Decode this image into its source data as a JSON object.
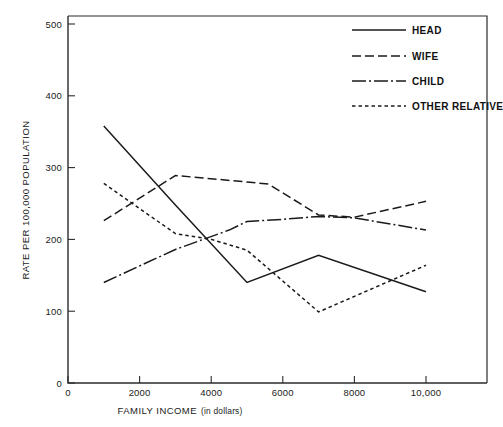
{
  "chart_data": {
    "type": "line",
    "title": "",
    "xlabel": "FAMILY INCOME (in dollars)",
    "xlabel_main": "FAMILY INCOME",
    "xlabel_sub": "(in dollars)",
    "ylabel": "RATE PER 100,000 POPULATION",
    "xlim": [
      0,
      11600
    ],
    "ylim": [
      0,
      520
    ],
    "grid": false,
    "legend_position": "top-right",
    "x_tick_values": [
      0,
      2000,
      4000,
      6000,
      8000,
      10000
    ],
    "x_tick_labels": [
      "0",
      "2000",
      "4000",
      "6000",
      "8000",
      "10,000"
    ],
    "y_tick_values": [
      0,
      100,
      200,
      300,
      400,
      500
    ],
    "y_tick_labels": [
      "0",
      "100",
      "200",
      "300",
      "400",
      "500"
    ],
    "x": [
      1000,
      3000,
      5000,
      7000,
      10000
    ],
    "series": [
      {
        "name": "HEAD",
        "label": "HEAD",
        "style": "solid",
        "dasharray": "none",
        "values": [
          358,
          248,
          140,
          178,
          127
        ],
        "points": [
          {
            "x": 1000,
            "y": 358
          },
          {
            "x": 3000,
            "y": 248
          },
          {
            "x": 5000,
            "y": 140
          },
          {
            "x": 7000,
            "y": 178
          },
          {
            "x": 10000,
            "y": 127
          }
        ]
      },
      {
        "name": "WIFE",
        "label": "WIFE",
        "style": "dashed",
        "dasharray": "9,4",
        "values": [
          226,
          289,
          278,
          234,
          253
        ],
        "points": [
          {
            "x": 1000,
            "y": 226
          },
          {
            "x": 3000,
            "y": 289
          },
          {
            "x": 5000,
            "y": 280
          },
          {
            "x": 5600,
            "y": 277
          },
          {
            "x": 7000,
            "y": 234
          },
          {
            "x": 8000,
            "y": 231
          },
          {
            "x": 10000,
            "y": 253
          }
        ]
      },
      {
        "name": "CHILD",
        "label": "CHILD",
        "style": "dash-dot",
        "dasharray": "14,3,2,3",
        "values": [
          140,
          186,
          225,
          232,
          213
        ],
        "points": [
          {
            "x": 1000,
            "y": 140
          },
          {
            "x": 3000,
            "y": 186
          },
          {
            "x": 4500,
            "y": 213
          },
          {
            "x": 5000,
            "y": 225
          },
          {
            "x": 6000,
            "y": 228
          },
          {
            "x": 7000,
            "y": 232
          },
          {
            "x": 8000,
            "y": 230
          },
          {
            "x": 10000,
            "y": 213
          }
        ]
      },
      {
        "name": "OTHER RELATIVE",
        "label": "OTHER RELATIVE",
        "style": "dotted",
        "dasharray": "3.5,3",
        "values": [
          278,
          208,
          185,
          99,
          164
        ],
        "points": [
          {
            "x": 1000,
            "y": 278
          },
          {
            "x": 3000,
            "y": 208
          },
          {
            "x": 4000,
            "y": 200
          },
          {
            "x": 5000,
            "y": 185
          },
          {
            "x": 7000,
            "y": 99
          },
          {
            "x": 10000,
            "y": 164
          }
        ]
      }
    ]
  },
  "legend": {
    "items": [
      {
        "label": "HEAD"
      },
      {
        "label": "WIFE"
      },
      {
        "label": "CHILD"
      },
      {
        "label": "OTHER RELATIVE"
      }
    ]
  },
  "colors": {
    "ink": "#1a1a1a",
    "axis": "#2b2b2b",
    "background": "#ffffff"
  }
}
